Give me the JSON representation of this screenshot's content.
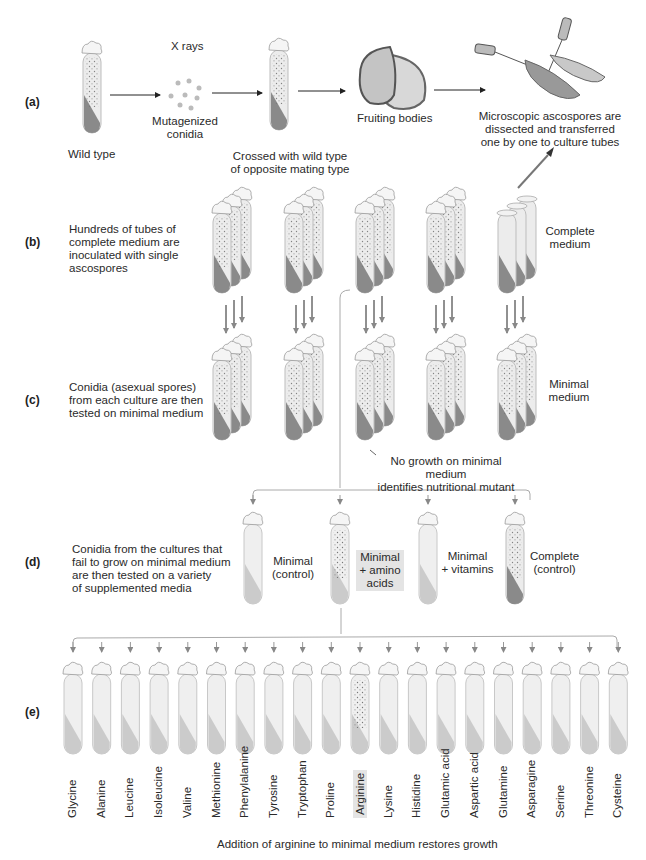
{
  "figure": {
    "panels": {
      "a": {
        "label": "(a)",
        "steps": {
          "wild_type": "Wild type",
          "xrays": "X rays",
          "mutagenized_1": "Mutagenized",
          "mutagenized_2": "conidia",
          "crossed_1": "Crossed with wild type",
          "crossed_2": "of opposite mating type",
          "fruiting": "Fruiting bodies",
          "micro_1": "Microscopic ascospores are",
          "micro_2": "dissected and transferred",
          "micro_3": "one by one to culture tubes"
        }
      },
      "b": {
        "label": "(b)",
        "desc_1": "Hundreds of tubes of",
        "desc_2": "complete medium are",
        "desc_3": "inoculated with single",
        "desc_4": "ascospores",
        "medium_1": "Complete",
        "medium_2": "medium"
      },
      "c": {
        "label": "(c)",
        "desc_1": "Conidia (asexual spores)",
        "desc_2": "from each culture are then",
        "desc_3": "tested on minimal medium",
        "medium_1": "Minimal",
        "medium_2": "medium",
        "note_1": "No growth on minimal medium",
        "note_2": "identifies nutritional mutant"
      },
      "d": {
        "label": "(d)",
        "desc_1": "Conidia from the cultures that",
        "desc_2": "fail to grow on minimal medium",
        "desc_3": "are then tested on a variety",
        "desc_4": "of supplemented media",
        "tubes": [
          {
            "l1": "Minimal",
            "l2": "(control)",
            "l3": ""
          },
          {
            "l1": "Minimal",
            "l2": "+ amino",
            "l3": "acids"
          },
          {
            "l1": "Minimal",
            "l2": "+ vitamins",
            "l3": ""
          },
          {
            "l1": "Complete",
            "l2": "(control)",
            "l3": ""
          }
        ]
      },
      "e": {
        "label": "(e)",
        "amino_acids": [
          "Glycine",
          "Alanine",
          "Leucine",
          "Isoleucine",
          "Valine",
          "Methionine",
          "Phenylalanine",
          "Tyrosine",
          "Tryptophan",
          "Proline",
          "Arginine",
          "Lysine",
          "Histidine",
          "Glutamic acid",
          "Aspartic acid",
          "Glutamine",
          "Asparagine",
          "Serine",
          "Threonine",
          "Cysteine"
        ],
        "highlighted": "Arginine",
        "conclusion": "Addition of arginine to minimal medium restores growth"
      }
    },
    "colors": {
      "medium_dark": "#8a8a8a",
      "medium_light": "#c8c8c8",
      "glass": "#ececec",
      "highlight": "#e4e4e4"
    }
  }
}
